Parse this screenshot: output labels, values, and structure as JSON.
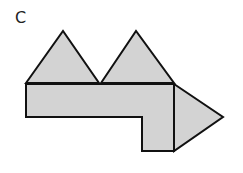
{
  "label": "C",
  "style": {
    "fill": "#d3d3d3",
    "stroke": "#111111",
    "stroke_width": 2,
    "background": "#ffffff"
  },
  "shapes": [
    {
      "name": "left-triangle",
      "type": "triangle",
      "points": [
        [
          26,
          83
        ],
        [
          63,
          31
        ],
        [
          99,
          83
        ]
      ]
    },
    {
      "name": "middle-triangle",
      "type": "triangle",
      "points": [
        [
          101,
          83
        ],
        [
          136,
          31
        ],
        [
          174,
          83
        ]
      ]
    },
    {
      "name": "l-shaped-body",
      "type": "polygon",
      "points": [
        [
          26,
          84
        ],
        [
          174,
          84
        ],
        [
          174,
          151
        ],
        [
          142,
          151
        ],
        [
          142,
          117
        ],
        [
          26,
          117
        ]
      ]
    },
    {
      "name": "right-arrow-triangle",
      "type": "triangle",
      "points": [
        [
          174,
          84
        ],
        [
          223,
          117
        ],
        [
          174,
          151
        ]
      ]
    }
  ]
}
